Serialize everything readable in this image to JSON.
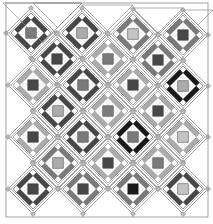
{
  "palette": {
    "black": "#1a1a1a",
    "dark": "#474747",
    "medium": "#7a7a7a",
    "light": "#ababab",
    "pale": "#c4c4c4",
    "sashing": "#ffffff",
    "outline": "#8c8c8c",
    "cornerstone": "#b8b8b8",
    "background": "#ffffff"
  },
  "border": {
    "x": 6,
    "y": 3,
    "width": 202,
    "height": 214
  },
  "block_half_diagonal": 25,
  "blocks": [
    {
      "row": 0,
      "cx": 31,
      "cy": 33,
      "frame": "dark",
      "center": "medium"
    },
    {
      "row": 0,
      "cx": 82,
      "cy": 33,
      "frame": "dark",
      "center": "light"
    },
    {
      "row": 0,
      "cx": 133,
      "cy": 34,
      "frame": "medium",
      "center": "pale"
    },
    {
      "row": 0,
      "cx": 183,
      "cy": 35,
      "frame": "medium",
      "center": "dark"
    },
    {
      "row": 1,
      "cx": 57,
      "cy": 59,
      "frame": "dark",
      "center": "dark"
    },
    {
      "row": 1,
      "cx": 108,
      "cy": 59,
      "frame": "light",
      "center": "medium"
    },
    {
      "row": 1,
      "cx": 158,
      "cy": 60,
      "frame": "medium",
      "center": "dark"
    },
    {
      "row": 2,
      "cx": 33,
      "cy": 85,
      "frame": "light",
      "center": "dark"
    },
    {
      "row": 2,
      "cx": 83,
      "cy": 85,
      "frame": "dark",
      "center": "medium"
    },
    {
      "row": 2,
      "cx": 133,
      "cy": 85,
      "frame": "light",
      "center": "dark"
    },
    {
      "row": 2,
      "cx": 183,
      "cy": 86,
      "frame": "black",
      "center": "light"
    },
    {
      "row": 3,
      "cx": 58,
      "cy": 111,
      "frame": "dark",
      "center": "light"
    },
    {
      "row": 3,
      "cx": 108,
      "cy": 111,
      "frame": "light",
      "center": "medium"
    },
    {
      "row": 3,
      "cx": 158,
      "cy": 111,
      "frame": "light",
      "center": "dark"
    },
    {
      "row": 4,
      "cx": 33,
      "cy": 137,
      "frame": "light",
      "center": "dark"
    },
    {
      "row": 4,
      "cx": 83,
      "cy": 137,
      "frame": "dark",
      "center": "medium"
    },
    {
      "row": 4,
      "cx": 133,
      "cy": 137,
      "frame": "black",
      "center": "medium"
    },
    {
      "row": 4,
      "cx": 183,
      "cy": 137,
      "frame": "light",
      "center": "pale"
    },
    {
      "row": 5,
      "cx": 58,
      "cy": 163,
      "frame": "medium",
      "center": "light"
    },
    {
      "row": 5,
      "cx": 108,
      "cy": 163,
      "frame": "light",
      "center": "dark"
    },
    {
      "row": 5,
      "cx": 158,
      "cy": 163,
      "frame": "light",
      "center": "medium"
    },
    {
      "row": 6,
      "cx": 33,
      "cy": 189,
      "frame": "dark",
      "center": "dark"
    },
    {
      "row": 6,
      "cx": 83,
      "cy": 189,
      "frame": "medium",
      "center": "dark"
    },
    {
      "row": 6,
      "cx": 133,
      "cy": 189,
      "frame": "medium",
      "center": "black"
    },
    {
      "row": 6,
      "cx": 183,
      "cy": 189,
      "frame": "dark",
      "center": "pale"
    }
  ],
  "top_triangles": [
    {
      "x1": 3,
      "x2": 82,
      "y": 3
    },
    {
      "x1": 33,
      "x2": 82,
      "y": 3
    },
    {
      "x1": 82,
      "x2": 133,
      "y": 5
    },
    {
      "x1": 133,
      "x2": 183,
      "y": 8
    },
    {
      "x1": 183,
      "x2": 213,
      "y": 10
    }
  ]
}
